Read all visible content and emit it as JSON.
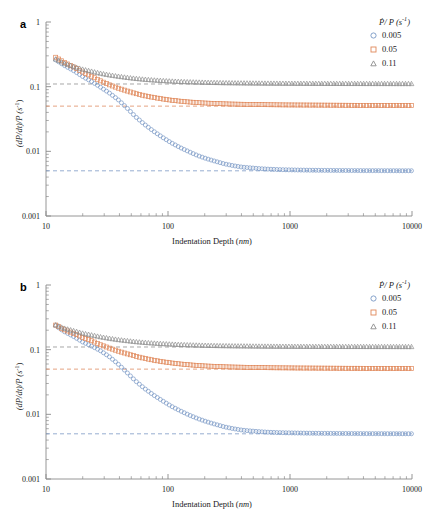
{
  "figure": {
    "panels": [
      {
        "label": "a",
        "xlabel_main": "Indentation Depth (",
        "xlabel_unit": "nm",
        "xlabel_close": ")",
        "ylabel_main": "(dP/dt)/P (",
        "ylabel_unit": "s",
        "ylabel_sup": "-1",
        "ylabel_close": ")"
      },
      {
        "label": "b",
        "xlabel_main": "Indentation Depth (",
        "xlabel_unit": "nm",
        "xlabel_close": ")",
        "ylabel_main": "(dP/dt)/P (",
        "ylabel_unit": "s",
        "ylabel_sup": "-1",
        "ylabel_close": ")"
      }
    ],
    "legend": {
      "title_symbol": "P",
      "title_rest": "/ P (",
      "title_unit": "s",
      "title_sup": "-1",
      "title_close": ")",
      "entries": [
        {
          "label": "0.005",
          "marker": "circle",
          "color": "#7796c4"
        },
        {
          "label": "0.05",
          "marker": "square",
          "color": "#e0885a"
        },
        {
          "label": "0.11",
          "marker": "triangle",
          "color": "#8c8c8c"
        }
      ]
    },
    "axis": {
      "x_ticks": [
        "10",
        "100",
        "1000",
        "10000"
      ],
      "y_ticks": [
        "1",
        "0.1",
        "0.01",
        "0.001"
      ]
    }
  },
  "chart_data": {
    "type": "scatter",
    "title": "",
    "xlabel": "Indentation Depth (nm)",
    "ylabel": "(dP/dt)/P (s^-1)",
    "xscale": "log",
    "yscale": "log",
    "xlim": [
      10,
      10000
    ],
    "ylim": [
      0.001,
      1
    ],
    "grid": false,
    "legend_position": "top-right",
    "legend_title": "Ṗ/ P (s^-1)",
    "panels": [
      {
        "panel": "a",
        "series": [
          {
            "name": "0.005",
            "marker": "circle",
            "color": "#7796c4",
            "asymptote": 0.005,
            "asymptote_line": "dashed",
            "x": [
              12,
              14,
              17,
              20,
              24,
              28,
              33,
              39,
              46,
              54,
              64,
              76,
              90,
              106,
              125,
              148,
              175,
              207,
              245,
              290,
              343,
              406,
              480,
              568,
              672,
              795,
              941,
              1113,
              1317,
              1558,
              1843,
              2181,
              2580,
              3052,
              3611,
              4272,
              5054,
              5979,
              7073,
              8367,
              9900
            ],
            "y": [
              0.26,
              0.215,
              0.175,
              0.143,
              0.118,
              0.098,
              0.08,
              0.063,
              0.047,
              0.0345,
              0.0262,
              0.0205,
              0.0165,
              0.0136,
              0.0115,
              0.0099,
              0.0086,
              0.0077,
              0.007,
              0.0064,
              0.006,
              0.0057,
              0.00555,
              0.0054,
              0.0053,
              0.00523,
              0.00518,
              0.00515,
              0.00512,
              0.0051,
              0.00508,
              0.00507,
              0.00506,
              0.00505,
              0.00504,
              0.00503,
              0.00503,
              0.00502,
              0.00502,
              0.00501,
              0.00501
            ]
          },
          {
            "name": "0.05",
            "marker": "square",
            "color": "#e0885a",
            "asymptote": 0.05,
            "asymptote_line": "dashed",
            "x": [
              12,
              14,
              17,
              20,
              24,
              28,
              33,
              39,
              46,
              54,
              64,
              76,
              90,
              106,
              125,
              148,
              175,
              207,
              245,
              290,
              343,
              406,
              480,
              568,
              672,
              795,
              941,
              1113,
              1317,
              1558,
              1843,
              2181,
              2580,
              3052,
              3611,
              4272,
              5054,
              5979,
              7073,
              8367,
              9900
            ],
            "y": [
              0.285,
              0.24,
              0.2,
              0.168,
              0.143,
              0.123,
              0.107,
              0.095,
              0.086,
              0.0785,
              0.0725,
              0.068,
              0.0645,
              0.0618,
              0.0597,
              0.058,
              0.0567,
              0.0557,
              0.0549,
              0.0543,
              0.0538,
              0.0534,
              0.0531,
              0.0528,
              0.0526,
              0.0524,
              0.0522,
              0.0521,
              0.052,
              0.0519,
              0.0518,
              0.0517,
              0.0516,
              0.0515,
              0.0514,
              0.0514,
              0.0513,
              0.0512,
              0.0512,
              0.0511,
              0.0511
            ]
          },
          {
            "name": "0.11",
            "marker": "triangle",
            "color": "#8c8c8c",
            "asymptote": 0.11,
            "asymptote_line": "dashed",
            "x": [
              12,
              14,
              17,
              20,
              24,
              28,
              33,
              39,
              46,
              54,
              64,
              76,
              90,
              106,
              125,
              148,
              175,
              207,
              245,
              290,
              343,
              406,
              480,
              568,
              672,
              795,
              941,
              1113,
              1317,
              1558,
              1843,
              2181,
              2580,
              3052,
              3611,
              4272,
              5054,
              5979,
              7073,
              8367,
              9900
            ],
            "y": [
              0.268,
              0.232,
              0.205,
              0.186,
              0.172,
              0.161,
              0.152,
              0.145,
              0.139,
              0.134,
              0.13,
              0.1268,
              0.1242,
              0.122,
              0.1202,
              0.1188,
              0.1176,
              0.1166,
              0.1158,
              0.1151,
              0.1146,
              0.1141,
              0.1137,
              0.1134,
              0.1131,
              0.1129,
              0.1127,
              0.1125,
              0.1124,
              0.1122,
              0.1121,
              0.112,
              0.1119,
              0.1118,
              0.1118,
              0.1117,
              0.1116,
              0.1116,
              0.1115,
              0.1115,
              0.1114
            ]
          }
        ]
      },
      {
        "panel": "b",
        "series": [
          {
            "name": "0.005",
            "marker": "circle",
            "color": "#7796c4",
            "asymptote": 0.005,
            "asymptote_line": "dashed",
            "x": [
              12,
              14,
              17,
              20,
              24,
              28,
              33,
              39,
              46,
              54,
              64,
              76,
              90,
              106,
              125,
              148,
              175,
              207,
              245,
              290,
              343,
              406,
              480,
              568,
              672,
              795,
              941,
              1113,
              1317,
              1558,
              1843,
              2181,
              2580,
              3052,
              3611,
              4272,
              5054,
              5979,
              7073,
              8367,
              9900
            ],
            "y": [
              0.235,
              0.192,
              0.158,
              0.131,
              0.112,
              0.096,
              0.078,
              0.06,
              0.0445,
              0.033,
              0.0252,
              0.0199,
              0.0162,
              0.0134,
              0.0114,
              0.0098,
              0.0086,
              0.0077,
              0.007,
              0.0064,
              0.006,
              0.0057,
              0.00553,
              0.00539,
              0.00529,
              0.00522,
              0.00518,
              0.00515,
              0.00512,
              0.0051,
              0.00508,
              0.00507,
              0.00506,
              0.00505,
              0.00504,
              0.00503,
              0.00503,
              0.00502,
              0.00502,
              0.00501,
              0.00501
            ]
          },
          {
            "name": "0.05",
            "marker": "square",
            "color": "#e0885a",
            "asymptote": 0.05,
            "asymptote_line": "dashed",
            "x": [
              12,
              14,
              17,
              20,
              24,
              28,
              33,
              39,
              46,
              54,
              64,
              76,
              90,
              106,
              125,
              148,
              175,
              207,
              245,
              290,
              343,
              406,
              480,
              568,
              672,
              795,
              941,
              1113,
              1317,
              1558,
              1843,
              2181,
              2580,
              3052,
              3611,
              4272,
              5054,
              5979,
              7073,
              8367,
              9900
            ],
            "y": [
              0.24,
              0.205,
              0.178,
              0.155,
              0.136,
              0.119,
              0.106,
              0.095,
              0.0865,
              0.0792,
              0.0733,
              0.0688,
              0.0652,
              0.0624,
              0.0602,
              0.0584,
              0.057,
              0.0559,
              0.0551,
              0.0544,
              0.0539,
              0.0535,
              0.0531,
              0.0529,
              0.0526,
              0.0524,
              0.0523,
              0.0521,
              0.052,
              0.0519,
              0.0518,
              0.0517,
              0.0516,
              0.0515,
              0.0515,
              0.0514,
              0.0513,
              0.0513,
              0.0512,
              0.0512,
              0.0511
            ]
          },
          {
            "name": "0.11",
            "marker": "triangle",
            "color": "#8c8c8c",
            "asymptote": 0.11,
            "asymptote_line": "dashed",
            "x": [
              12,
              14,
              17,
              20,
              24,
              28,
              33,
              39,
              46,
              54,
              64,
              76,
              90,
              106,
              125,
              148,
              175,
              207,
              245,
              290,
              343,
              406,
              480,
              568,
              672,
              795,
              941,
              1113,
              1317,
              1558,
              1843,
              2181,
              2580,
              3052,
              3611,
              4272,
              5054,
              5979,
              7073,
              8367,
              9900
            ],
            "y": [
              0.242,
              0.216,
              0.196,
              0.18,
              0.168,
              0.158,
              0.15,
              0.143,
              0.138,
              0.133,
              0.1295,
              0.1264,
              0.1239,
              0.1218,
              0.1201,
              0.1187,
              0.1175,
              0.1165,
              0.1157,
              0.1151,
              0.1145,
              0.1141,
              0.1137,
              0.1133,
              0.1131,
              0.1128,
              0.1126,
              0.1125,
              0.1123,
              0.1122,
              0.1121,
              0.112,
              0.1119,
              0.1118,
              0.1118,
              0.1117,
              0.1116,
              0.1116,
              0.1115,
              0.1115,
              0.1114
            ]
          }
        ]
      }
    ]
  }
}
